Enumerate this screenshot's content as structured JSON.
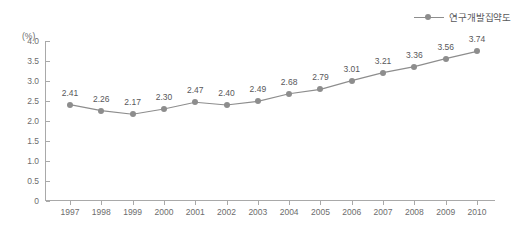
{
  "legend": {
    "label": "연구개발집약도",
    "marker_icon": "line-dot-marker-icon",
    "color": "#8d8d8d"
  },
  "axes": {
    "y_unit": "(%)",
    "y_ticks": [
      "4.0",
      "3.5",
      "3.0",
      "2.5",
      "2.0",
      "1.5",
      "1.0",
      "0.5",
      "0"
    ],
    "x_ticks": [
      "1997",
      "1998",
      "1999",
      "2000",
      "2001",
      "2002",
      "2003",
      "2004",
      "2005",
      "2006",
      "2007",
      "2008",
      "2009",
      "2010"
    ]
  },
  "chart_data": {
    "type": "line",
    "title": "",
    "xlabel": "",
    "ylabel": "(%)",
    "categories": [
      "1997",
      "1998",
      "1999",
      "2000",
      "2001",
      "2002",
      "2003",
      "2004",
      "2005",
      "2006",
      "2007",
      "2008",
      "2009",
      "2010"
    ],
    "values": [
      2.41,
      2.26,
      2.17,
      2.3,
      2.47,
      2.4,
      2.49,
      2.68,
      2.79,
      3.01,
      3.21,
      3.36,
      3.56,
      3.74
    ],
    "data_labels": [
      "2.41",
      "2.26",
      "2.17",
      "2.30",
      "2.47",
      "2.40",
      "2.49",
      "2.68",
      "2.79",
      "3.01",
      "3.21",
      "3.36",
      "3.56",
      "3.74"
    ],
    "series": [
      {
        "name": "연구개발집약도",
        "values": [
          2.41,
          2.26,
          2.17,
          2.3,
          2.47,
          2.4,
          2.49,
          2.68,
          2.79,
          3.01,
          3.21,
          3.36,
          3.56,
          3.74
        ],
        "color": "#8d8d8d"
      }
    ],
    "ylim": [
      0,
      4.0
    ],
    "ytick_values": [
      4.0,
      3.5,
      3.0,
      2.5,
      2.0,
      1.5,
      1.0,
      0.5,
      0
    ],
    "grid": false,
    "legend_position": "top-right",
    "line_color": "#8d8d8d",
    "marker_color": "#8d8d8d"
  }
}
